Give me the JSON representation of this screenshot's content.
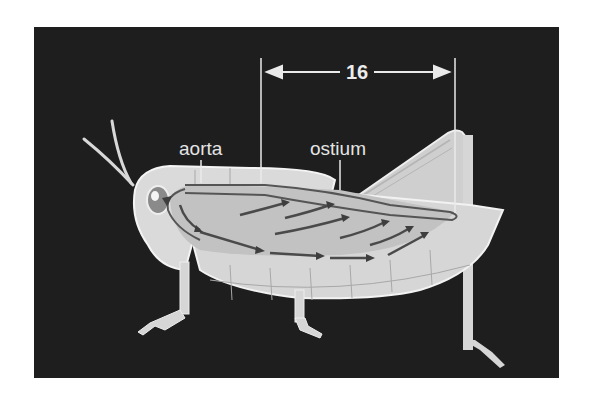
{
  "figure": {
    "background_color": "#1e1e1e",
    "body_color": "#d4d4d4",
    "outline_color": "#f0f0f0",
    "vessel_color": "#5a5a5a"
  },
  "labels": {
    "aorta": "aorta",
    "ostium": "ostium",
    "measurement": "16"
  }
}
